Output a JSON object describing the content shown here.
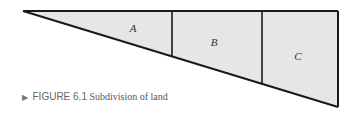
{
  "diagram": {
    "title": "Subdivision of land",
    "fill_color": "#e6e6e6",
    "stroke_color": "#1a1a1a",
    "parcels": [
      {
        "label": "A"
      },
      {
        "label": "B"
      },
      {
        "label": "C"
      }
    ]
  },
  "caption": {
    "marker": "▶",
    "figure_label": "FIGURE 6.1",
    "text": "Subdivision of land"
  }
}
